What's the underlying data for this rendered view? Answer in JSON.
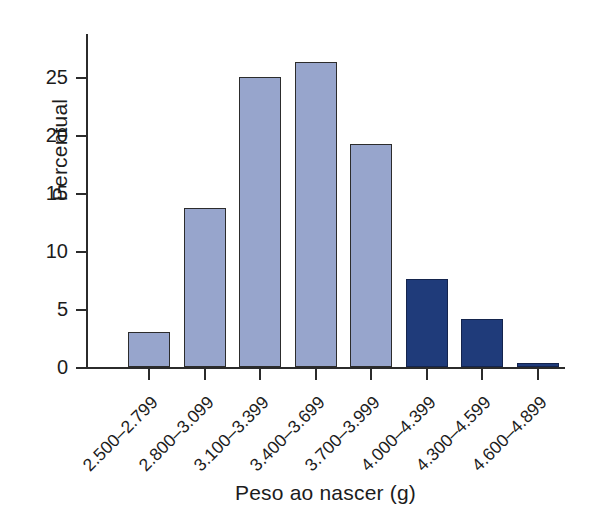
{
  "chart_data": {
    "type": "bar",
    "title": "",
    "xlabel": "Peso ao nascer (g)",
    "ylabel": "Percentual",
    "categories": [
      "2.500–2.799",
      "2.800–3.099",
      "3.100–3.399",
      "3.400–3.699",
      "3.700–3.999",
      "4.000–4.399",
      "4.300–4.599",
      "4.600–4.899"
    ],
    "values": [
      3.0,
      13.7,
      25.0,
      26.3,
      19.2,
      7.6,
      4.1,
      0.35
    ],
    "ylim": [
      0,
      29
    ],
    "yticks": [
      0,
      5,
      10,
      15,
      20,
      25
    ],
    "ytick_labels": [
      "0",
      "5",
      "10",
      "15",
      "20",
      "25"
    ],
    "grid": false,
    "legend": false,
    "bar_colors": [
      "#97a5cc",
      "#97a5cc",
      "#97a5cc",
      "#97a5cc",
      "#97a5cc",
      "#1f3b7a",
      "#1f3b7a",
      "#1f3b7a"
    ],
    "colors": {
      "light_bar": "#97a5cc",
      "dark_bar": "#1f3b7a",
      "bar_edge": "#2c2c2c",
      "axis": "#2b2b2b",
      "text": "#1c1c1c",
      "background": "#ffffff"
    }
  }
}
